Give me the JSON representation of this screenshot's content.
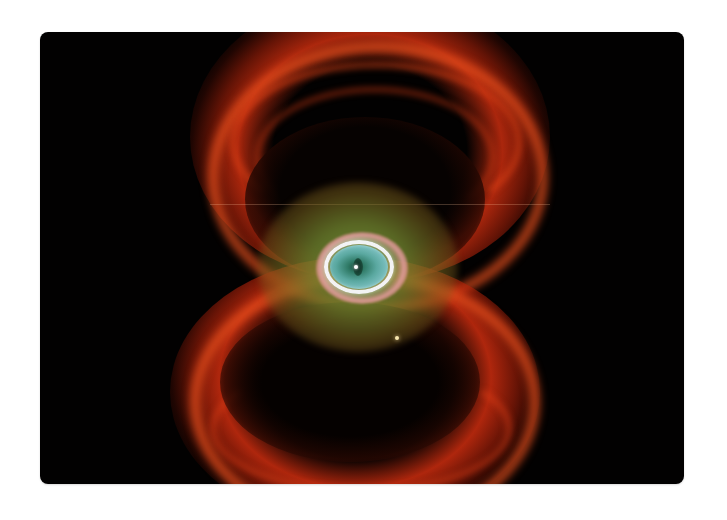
{
  "image": {
    "subject": "Hourglass planetary nebula",
    "description": "Red hourglass-shaped nebula with two looping lobes above and below a central green halo and a glowing blue-green 'eye' ringed in white and pink, set against a black background",
    "frame": {
      "x": 40,
      "y": 32,
      "width": 644,
      "height": 452,
      "corner_radius": 8
    },
    "colors": {
      "page_background": "#ffffff",
      "space_background": "#020101",
      "nebula_red": "#e04a1a",
      "nebula_dark_red": "#b42a0a",
      "halo_green": "#6e822d",
      "ring_pink": "#eba0a5",
      "ring_white": "#fafaff",
      "eye_teal": "#7cc0c0",
      "eye_center": "#1a4a3a",
      "field_star": "#f8e8b0"
    }
  }
}
